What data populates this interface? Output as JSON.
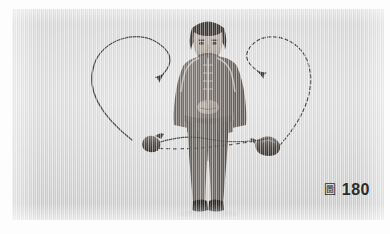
{
  "page": {
    "background_color": "#ffffff",
    "plate_color": "#d9d9d9"
  },
  "photo": {
    "alt": "martial-arts-demonstration-photograph",
    "subject": "woman standing facing forward, hands clasped at waist, holding a meteor-hammer rope weapon",
    "ink_color": "#3a3a3a"
  },
  "figure": {
    "skin_color": "#b8aca2",
    "hair_color": "#3d3a38",
    "jacket_color": "#7a736d",
    "jacket_trim_color": "#cfc8c0",
    "trousers_color": "#6e6863",
    "shoe_color": "#2b2826",
    "labels": {
      "head": "head",
      "jacket": "traditional-jacket",
      "trousers": "trousers",
      "shoes": "shoes",
      "hands": "clasped-hands"
    }
  },
  "props": {
    "left_weight_label": "rope-weight-left",
    "right_weight_label": "rope-weight-right",
    "weight_color": "#56504b"
  },
  "annotations": {
    "solid_path": {
      "name": "solid-motion-path",
      "style": "solid",
      "color": "#4a4a4a",
      "arrow_label": "solid-path-arrowhead",
      "direction": "down-left"
    },
    "dashed_path": {
      "name": "dashed-motion-path",
      "style": "dashed",
      "color": "#4a4a4a",
      "arrow_label": "dashed-path-arrowhead",
      "direction": "down-left"
    },
    "solid_rope": {
      "name": "solid-rope-line",
      "color": "#4a4a4a"
    },
    "dashed_rope": {
      "name": "dashed-rope-line",
      "color": "#4a4a4a"
    }
  },
  "caption": {
    "figure_glyph": "圖",
    "figure_number": "180"
  }
}
